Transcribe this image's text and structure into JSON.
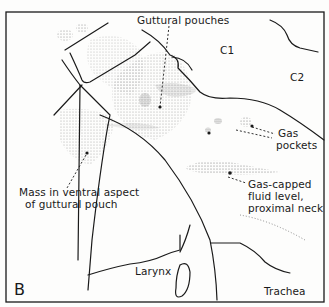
{
  "figure": {
    "panel_letter": "B",
    "colors": {
      "ink": "#1a1a1a",
      "stipple": "#6f6f6f",
      "background": "#fdfdfc"
    },
    "labels": {
      "guttural_pouches": "Guttural pouches",
      "c1": "C1",
      "c2": "C2",
      "gas_pockets_line1": "Gas",
      "gas_pockets_line2": "pockets",
      "gas_capped_line1": "Gas-capped",
      "gas_capped_line2": "fluid level,",
      "gas_capped_line3": "proximal neck",
      "mass_line1": "Mass in ventral aspect",
      "mass_line2": "of guttural pouch",
      "larynx": "Larynx",
      "trachea": "Trachea"
    }
  }
}
